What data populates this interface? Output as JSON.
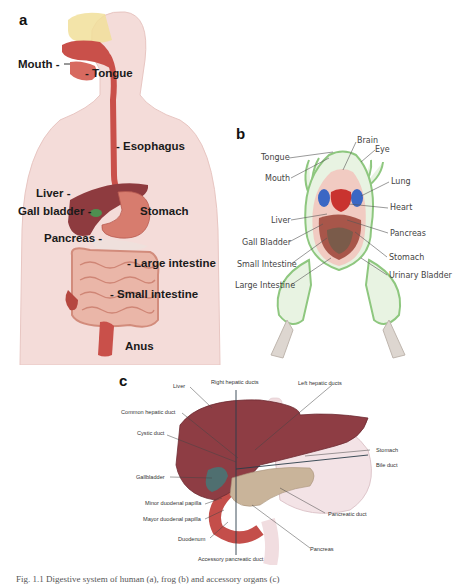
{
  "panels": {
    "a": {
      "letter": "a",
      "title": "Human digestive system",
      "labels": {
        "mouth": "Mouth -",
        "tongue": "- Tongue",
        "esophagus": "- Esophagus",
        "liver": "Liver -",
        "gall_bladder": "Gall bladder -",
        "stomach": "Stomach",
        "pancreas": "Pancreas -",
        "large_intestine": "- Large intestine",
        "small_intestine": "- Small intestine",
        "anus": "Anus"
      }
    },
    "b": {
      "letter": "b",
      "title": "Frog internal anatomy",
      "labels": {
        "brain": "Brain",
        "eye": "Eye",
        "tongue": "Tongue",
        "mouth": "Mouth",
        "lung": "Lung",
        "heart": "Heart",
        "liver": "Liver",
        "pancreas": "Pancreas",
        "gall_bladder": "Gall Bladder",
        "stomach": "Stomach",
        "small_intestine": "Small Intestine",
        "urinary_bladder": "Urinary Bladder",
        "large_intestine": "Large Intestine"
      }
    },
    "c": {
      "letter": "c",
      "title": "Liver, gallbladder, pancreas and ducts",
      "labels": {
        "liver": "Liver",
        "right_hepatic_ducts": "Right hepatic ducts",
        "left_hepatic_ducts": "Left hepatic ducts",
        "common_hepatic_duct": "Common hepatic duct",
        "cystic_duct": "Cystic duct",
        "stomach": "Stomach",
        "bile_duct": "Bile duct",
        "gallbladder": "Gallbladder",
        "minor_duodenal_papilla": "Minor duodenal papilla",
        "mayor_duodenal_papilla": "Mayor duodenal papilla",
        "pancreatic_duct": "Pancreatic duct",
        "duodenum": "Duodenum",
        "pancreas": "Pancreas",
        "accessory_pancreatic_duct": "Accessory pancreatic duct"
      }
    }
  },
  "caption": "Fig. 1.1  Digestive system of human (a), frog (b) and accessory organs (c)",
  "colors": {
    "skin": "#f3d9d6",
    "organ_red": "#c9504a",
    "liver": "#8e3b3f",
    "frog_green": "#9ccf8e",
    "gallbladder": "#4f6f70",
    "pancreas": "#c9b49a",
    "lung_blue": "#3b67c4"
  }
}
